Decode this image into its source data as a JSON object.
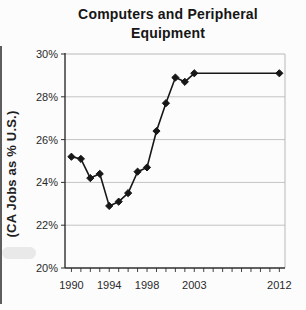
{
  "title": {
    "line1": "Computers and Peripheral",
    "line2": "Equipment"
  },
  "y_axis_title": "(CA Jobs as % U.S.)",
  "colors": {
    "line": "#171717",
    "marker": "#171717",
    "grid": "#c3c3c3",
    "axis": "#2f2f2f",
    "box_border": "#b8b8b8",
    "tick_text": "#2a2a2a",
    "title_text": "#161616",
    "background": "#fcfcfc"
  },
  "chart_data": {
    "type": "line",
    "title": "Computers and Peripheral Equipment",
    "xlabel": "",
    "ylabel": "(CA Jobs as % U.S.)",
    "marker": "diamond",
    "grid": true,
    "legend": "none",
    "x": [
      1990,
      1991,
      1992,
      1993,
      1994,
      1995,
      1996,
      1997,
      1998,
      1999,
      2000,
      2001,
      2002,
      2003,
      2012
    ],
    "y": [
      25.2,
      25.1,
      24.2,
      24.4,
      22.9,
      23.1,
      23.5,
      24.5,
      24.7,
      26.4,
      27.7,
      28.9,
      28.7,
      29.1,
      29.1
    ],
    "xlim": [
      1989.32,
      2012.6
    ],
    "ylim": [
      20,
      30
    ],
    "yticks": [
      20,
      22,
      24,
      26,
      28,
      30
    ],
    "ytick_labels": [
      "20%",
      "22%",
      "24%",
      "26%",
      "28%",
      "30%"
    ],
    "xtick_years_labeled": [
      1990,
      1994,
      1998,
      2003,
      2012
    ],
    "xtick_labels": [
      "1990",
      "1994",
      "1998",
      "2003",
      "2012"
    ],
    "xticks_minor_every_year": true,
    "note": "single series, annual 1990-2003 then gap to 2012 connected by straight segment"
  }
}
